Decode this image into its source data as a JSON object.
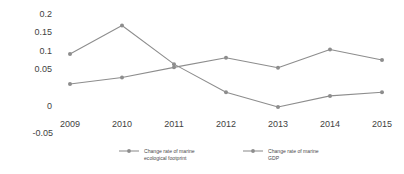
{
  "chart_data": {
    "type": "line",
    "title": "",
    "xlabel": "",
    "ylabel": "",
    "categories": [
      "2009",
      "2010",
      "2011",
      "2012",
      "2013",
      "2014",
      "2015"
    ],
    "x": [
      2009,
      2010,
      2011,
      2012,
      2013,
      2014,
      2015
    ],
    "ylim": [
      -0.05,
      0.2
    ],
    "yticks": [
      -0.05,
      0,
      0.05,
      0.1,
      0.15,
      0.2
    ],
    "ytick_labels": [
      "-0.05",
      "0",
      "0.05",
      "0.1",
      "0.15",
      "0.2"
    ],
    "xtick_labels": [
      "2009",
      "2010",
      "2011",
      "2012",
      "2013",
      "2014",
      "2015"
    ],
    "grid": false,
    "legend_position": "bottom",
    "marker": "circle",
    "series": [
      {
        "name": "Change rate of marine ecological footprint",
        "name_line1": "Change rate of marine",
        "name_line2": "ecological footprint",
        "color": "#8d8d8d",
        "values": [
          0.113,
          0.175,
          0.091,
          0.03,
          -0.002,
          0.022,
          0.03
        ]
      },
      {
        "name": "Change rate of marine GDP",
        "name_line1": "Change rate of marine",
        "name_line2": "GDP",
        "color": "#8d8d8d",
        "values": [
          0.048,
          0.062,
          0.084,
          0.105,
          0.083,
          0.123,
          0.1
        ]
      }
    ]
  },
  "axis": {
    "ytick_0": "0.2",
    "ytick_1": "0.15",
    "ytick_2": "0.1",
    "ytick_3": "0.05",
    "ytick_4": "0",
    "ytick_5": "-0.05",
    "xtick_0": "2009",
    "xtick_1": "2010",
    "xtick_2": "2011",
    "xtick_3": "2012",
    "xtick_4": "2013",
    "xtick_5": "2014",
    "xtick_6": "2015"
  },
  "legend": {
    "entry_0_line1": "Change rate of marine",
    "entry_0_line2": "ecological footprint",
    "entry_1_line1": "Change rate of marine",
    "entry_1_line2": "GDP"
  },
  "colors": {
    "series_gray": "#8d8d8d",
    "text_gray": "#3f3f3f",
    "background": "#ffffff"
  }
}
